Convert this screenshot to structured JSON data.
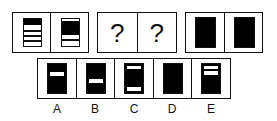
{
  "puzzle": {
    "question_mark": "?",
    "options": [
      {
        "label": "A"
      },
      {
        "label": "B"
      },
      {
        "label": "C"
      },
      {
        "label": "D"
      },
      {
        "label": "E"
      }
    ]
  },
  "colors": {
    "ink": "#111111",
    "fill": "#000000",
    "background": "#ffffff"
  }
}
